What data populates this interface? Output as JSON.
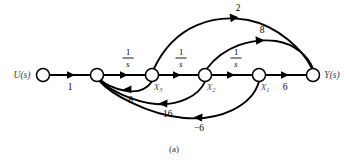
{
  "figure": {
    "caption": "(a)",
    "input_label": "U(s)",
    "output_label": "Y(s)",
    "stroke_color": "#000000",
    "background_color": "#ffffff"
  },
  "nodes": [
    {
      "id": "u",
      "label": "U(s)",
      "label_side": "left",
      "x": 43,
      "y": 75,
      "r": 6.5
    },
    {
      "id": "n2",
      "label": "",
      "label_side": "none",
      "x": 97,
      "y": 75,
      "r": 6.5
    },
    {
      "id": "x3",
      "label": "X",
      "sub": "3",
      "label_side": "below-right",
      "x": 152,
      "y": 75,
      "r": 6.5
    },
    {
      "id": "x2",
      "label": "X",
      "sub": "2",
      "label_side": "below-right",
      "x": 205,
      "y": 75,
      "r": 6.5
    },
    {
      "id": "x1",
      "label": "X",
      "sub": "1",
      "label_side": "below-right",
      "x": 259,
      "y": 75,
      "r": 6.5
    },
    {
      "id": "y",
      "label": "Y(s)",
      "label_side": "right",
      "x": 313,
      "y": 75,
      "r": 6.5
    }
  ],
  "edges": [
    {
      "id": "e-u-n2",
      "from": "u",
      "to": "n2",
      "gain": "1",
      "gain_type": "plain",
      "position": "below",
      "shape": "straight"
    },
    {
      "id": "e-n2-x3",
      "from": "n2",
      "to": "x3",
      "gain": "1/s",
      "gain_type": "fraction",
      "numerator": "1",
      "denominator": "s",
      "position": "above",
      "shape": "straight"
    },
    {
      "id": "e-x3-x2",
      "from": "x3",
      "to": "x2",
      "gain": "1/s",
      "gain_type": "fraction",
      "numerator": "1",
      "denominator": "s",
      "position": "above",
      "shape": "straight"
    },
    {
      "id": "e-x2-x1",
      "from": "x2",
      "to": "x1",
      "gain": "1/s",
      "gain_type": "fraction",
      "numerator": "1",
      "denominator": "s",
      "position": "above",
      "shape": "straight"
    },
    {
      "id": "e-x1-y",
      "from": "x1",
      "to": "y",
      "gain": "6",
      "gain_type": "plain",
      "position": "below",
      "shape": "straight"
    },
    {
      "id": "e-x3-y",
      "from": "x3",
      "to": "y",
      "gain": "2",
      "gain_type": "plain",
      "position": "above",
      "shape": "arc-up-outer"
    },
    {
      "id": "e-x2-y",
      "from": "x2",
      "to": "y",
      "gain": "8",
      "gain_type": "plain",
      "position": "above",
      "shape": "arc-up-inner"
    },
    {
      "id": "e-x3-n2",
      "from": "x3",
      "to": "n2",
      "gain": "−8",
      "gain_type": "plain",
      "position": "below",
      "shape": "arc-down-inner"
    },
    {
      "id": "e-x2-n2",
      "from": "x2",
      "to": "n2",
      "gain": "−16",
      "gain_type": "plain",
      "position": "below",
      "shape": "arc-down-mid"
    },
    {
      "id": "e-x1-n2",
      "from": "x1",
      "to": "n2",
      "gain": "−6",
      "gain_type": "plain",
      "position": "below",
      "shape": "arc-down-outer"
    }
  ],
  "gain_labels": {
    "u_to_n2": "1",
    "n2_to_x3_num": "1",
    "n2_to_x3_den": "s",
    "x3_to_x2_num": "1",
    "x3_to_x2_den": "s",
    "x2_to_x1_num": "1",
    "x2_to_x1_den": "s",
    "x1_to_y": "6",
    "x3_to_y": "2",
    "x2_to_y": "8",
    "x3_to_n2": "−8",
    "x2_to_n2": "−16",
    "x1_to_n2": "−6"
  },
  "state_labels": {
    "x3_base": "X",
    "x3_sub": "3",
    "x2_base": "X",
    "x2_sub": "2",
    "x1_base": "X",
    "x1_sub": "1"
  }
}
